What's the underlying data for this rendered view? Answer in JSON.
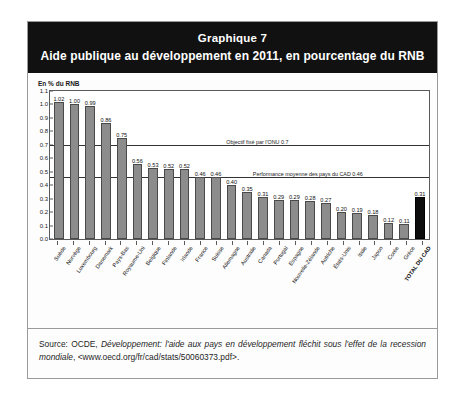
{
  "figure": {
    "banner": {
      "line1": "Graphique 7",
      "line2": "Aide publique au développement en 2011, en pourcentage du RNB"
    },
    "source": {
      "prefix": "Source: OCDE, ",
      "italic": "Développement: l'aide aux pays en développement fléchit sous l'effet de la recession mondiale",
      "suffix": ", <www.oecd.org/fr/cad/stats/50060373.pdf>."
    }
  },
  "chart_data": {
    "type": "bar",
    "title": "Aide publique au développement en 2011, en pourcentage du RNB",
    "subtitle": "Graphique 7",
    "xlabel": "",
    "ylabel": "En % du RNB",
    "ylim": [
      0.0,
      1.1
    ],
    "ytick_labels": [
      "1.1",
      "1.0",
      "0.9",
      "0.8",
      "0.7",
      "0.6",
      "0.5",
      "0.4",
      "0.3",
      "0.2",
      "0.1",
      "0.0"
    ],
    "yticks": [
      1.1,
      1.0,
      0.9,
      0.8,
      0.7,
      0.6,
      0.5,
      0.4,
      0.3,
      0.2,
      0.1,
      0.0
    ],
    "grid": false,
    "legend": "none",
    "bar_color": "#8c8c8c",
    "total_bar_color": "#0d0d0d",
    "categories": [
      "Suède",
      "Norvège",
      "Luxembourg",
      "Danemark",
      "Pays-Bas",
      "Royaume-Uni",
      "Belgique",
      "Finlande",
      "Irlande",
      "France",
      "Suisse",
      "Allemagne",
      "Australie",
      "Canada",
      "Portugal",
      "Espagne",
      "Nouvelle-Zélande",
      "Autriche",
      "États-Unis",
      "Italie",
      "Japon",
      "Corée",
      "Grèce",
      "TOTAL DU CAD"
    ],
    "values": [
      1.02,
      1.0,
      0.99,
      0.86,
      0.75,
      0.56,
      0.53,
      0.52,
      0.52,
      0.46,
      0.46,
      0.4,
      0.35,
      0.31,
      0.29,
      0.29,
      0.28,
      0.27,
      0.2,
      0.19,
      0.18,
      0.12,
      0.11,
      0.31
    ],
    "value_labels": [
      "1.02",
      "1.00",
      "0.99",
      "0.86",
      "0.75",
      "0.56",
      "0.53",
      "0.52",
      "0.52",
      "0.46",
      "0.46",
      "0.40",
      "0.35",
      "0.31",
      "0.29",
      "0.29",
      "0.28",
      "0.27",
      "0.20",
      "0.19",
      "0.18",
      "0.12",
      "0.11",
      "0.31"
    ],
    "annotations": [
      {
        "name": "un-target-line",
        "value": 0.7,
        "label": "Objectif fixé par l'ONU 0.7",
        "label_left_pct": 46
      },
      {
        "name": "dac-average-line",
        "value": 0.46,
        "label": "Performance moyenne des pays du CAD 0.46",
        "label_left_pct": 53
      }
    ]
  }
}
